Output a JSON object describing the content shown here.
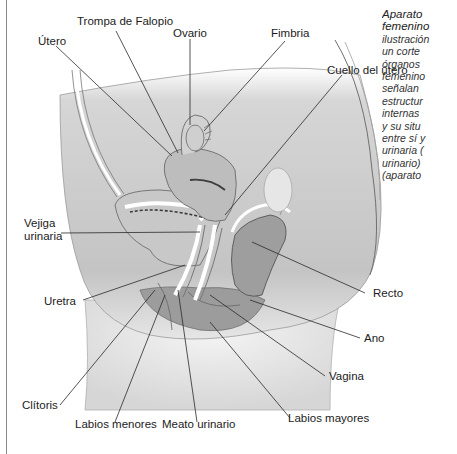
{
  "figure": {
    "caption_lines": [
      "Aparato",
      "femenino",
      "ilustración",
      "un corte",
      "órganos",
      "femenino",
      "señalan",
      "estructur",
      "internas",
      "y su situ",
      "entre sí y",
      "urinaria (",
      "urinario)",
      "(aparato"
    ],
    "labels": {
      "trompa": "Trompa de Falopio",
      "ovario": "Ovario",
      "fimbria": "Fimbria",
      "utero": "Útero",
      "cuello": "Cuello del útero",
      "vejiga_1": "Vejiga",
      "vejiga_2": "urinaria",
      "uretra": "Uretra",
      "recto": "Recto",
      "ano": "Ano",
      "vagina": "Vagina",
      "clitoris": "Clítoris",
      "labios_menores": "Labios menores",
      "meato": "Meato urinario",
      "labios_mayores": "Labios mayores"
    },
    "colors": {
      "tissue_light": "#d9d9d9",
      "tissue_mid": "#b8b8b8",
      "tissue_dark": "#8f8f8f",
      "leader_line": "#2a2a2a"
    }
  }
}
